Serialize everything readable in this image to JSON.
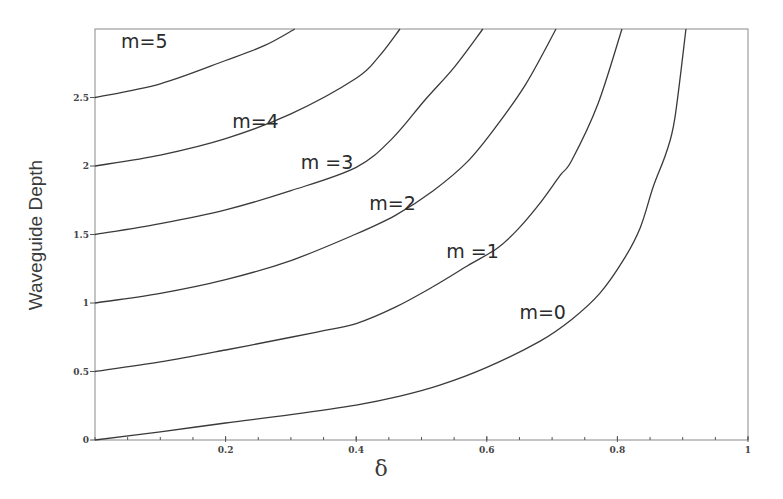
{
  "chart_data": {
    "type": "line",
    "title": "",
    "xlabel": "δ",
    "ylabel": "Waveguide Depth",
    "xlim": [
      0,
      1
    ],
    "ylim": [
      0,
      3
    ],
    "grid": false,
    "x_ticks": [
      {
        "value": 0,
        "label": "0"
      },
      {
        "value": 0.2,
        "label": "0.2"
      },
      {
        "value": 0.4,
        "label": "0.4"
      },
      {
        "value": 0.6,
        "label": "0.6"
      },
      {
        "value": 0.8,
        "label": "0.8"
      },
      {
        "value": 1,
        "label": "1"
      }
    ],
    "x_minor_step": 0.05,
    "y_ticks": [
      {
        "value": 0,
        "label": "0"
      },
      {
        "value": 0.5,
        "label": "0.5"
      },
      {
        "value": 1,
        "label": "1"
      },
      {
        "value": 1.5,
        "label": "1.5"
      },
      {
        "value": 2,
        "label": "2"
      },
      {
        "value": 2.5,
        "label": "2.5"
      }
    ],
    "series": [
      {
        "name": "m=0",
        "label": "m=0",
        "x": [
          0,
          0.1,
          0.2,
          0.3,
          0.4,
          0.467,
          0.528,
          0.6,
          0.681,
          0.73,
          0.773,
          0.81,
          0.835,
          0.855,
          0.875,
          0.888,
          0.905
        ],
        "y": [
          0,
          0.06,
          0.124,
          0.185,
          0.255,
          0.32,
          0.4,
          0.53,
          0.72,
          0.88,
          1.07,
          1.32,
          1.55,
          1.85,
          2.1,
          2.35,
          3.0
        ]
      },
      {
        "name": "m=1",
        "label": "m =1",
        "x": [
          0,
          0.1,
          0.2,
          0.3,
          0.352,
          0.4,
          0.46,
          0.518,
          0.57,
          0.616,
          0.646,
          0.68,
          0.712,
          0.73,
          0.77,
          0.807
        ],
        "y": [
          0.5,
          0.57,
          0.657,
          0.75,
          0.8,
          0.85,
          0.97,
          1.12,
          1.27,
          1.4,
          1.53,
          1.72,
          1.93,
          2.04,
          2.45,
          3.0
        ]
      },
      {
        "name": "m=2",
        "label": "m=2",
        "x": [
          0,
          0.1,
          0.2,
          0.3,
          0.398,
          0.46,
          0.518,
          0.57,
          0.613,
          0.66,
          0.706
        ],
        "y": [
          1.0,
          1.07,
          1.17,
          1.31,
          1.5,
          1.64,
          1.82,
          2.03,
          2.28,
          2.6,
          3.0
        ]
      },
      {
        "name": "m=3",
        "label": "m =3",
        "x": [
          0,
          0.1,
          0.2,
          0.3,
          0.4,
          0.455,
          0.505,
          0.55,
          0.594
        ],
        "y": [
          1.5,
          1.58,
          1.68,
          1.82,
          1.99,
          2.2,
          2.48,
          2.72,
          3.0
        ]
      },
      {
        "name": "m=4",
        "label": "m=4",
        "x": [
          0,
          0.1,
          0.2,
          0.3,
          0.4,
          0.435,
          0.467
        ],
        "y": [
          2.0,
          2.08,
          2.2,
          2.38,
          2.64,
          2.8,
          3.0
        ]
      },
      {
        "name": "m=5",
        "label": "m=5",
        "x": [
          0,
          0.1,
          0.2,
          0.26,
          0.306
        ],
        "y": [
          2.5,
          2.6,
          2.77,
          2.88,
          3.0
        ]
      }
    ],
    "annotations": [
      {
        "text": "m=5",
        "x": 0.04,
        "y": 2.9
      },
      {
        "text": "m=4",
        "x": 0.21,
        "y": 2.32
      },
      {
        "text": "m =3",
        "x": 0.315,
        "y": 2.02
      },
      {
        "text": "m=2",
        "x": 0.42,
        "y": 1.72
      },
      {
        "text": "m =1",
        "x": 0.538,
        "y": 1.37
      },
      {
        "text": "m=0",
        "x": 0.65,
        "y": 0.92
      }
    ]
  }
}
